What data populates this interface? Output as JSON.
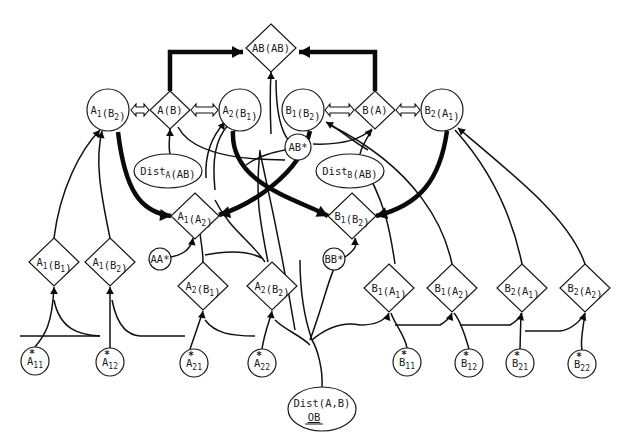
{
  "diagram": {
    "nodes": [
      {
        "id": "AB_AB",
        "shape": "diamond",
        "x": 271,
        "y": 48,
        "w": 50,
        "h": 48,
        "text": [
          {
            "t": "AB(AB)"
          }
        ]
      },
      {
        "id": "A1_B2_c",
        "shape": "circle",
        "x": 108,
        "y": 110,
        "r": 21,
        "text": [
          {
            "t": "A"
          },
          {
            "t": "1",
            "sub": true
          },
          {
            "t": "(B"
          },
          {
            "t": "2",
            "sub": true
          },
          {
            "t": ")"
          }
        ]
      },
      {
        "id": "A_B",
        "shape": "diamond",
        "x": 170,
        "y": 110,
        "w": 40,
        "h": 38,
        "text": [
          {
            "t": "A(B)"
          }
        ]
      },
      {
        "id": "A2_B1_c",
        "shape": "circle",
        "x": 240,
        "y": 110,
        "r": 21,
        "text": [
          {
            "t": "A"
          },
          {
            "t": "2",
            "sub": true
          },
          {
            "t": "(B"
          },
          {
            "t": "1",
            "sub": true
          },
          {
            "t": ")"
          }
        ]
      },
      {
        "id": "B1_B2_c",
        "shape": "circle",
        "x": 303,
        "y": 110,
        "r": 21,
        "text": [
          {
            "t": "B"
          },
          {
            "t": "1",
            "sub": true
          },
          {
            "t": "(B"
          },
          {
            "t": "2",
            "sub": true
          },
          {
            "t": ")"
          }
        ]
      },
      {
        "id": "B_A",
        "shape": "diamond",
        "x": 375,
        "y": 110,
        "w": 40,
        "h": 38,
        "text": [
          {
            "t": "B(A)"
          }
        ]
      },
      {
        "id": "B2_A1_c",
        "shape": "circle",
        "x": 442,
        "y": 110,
        "r": 21,
        "text": [
          {
            "t": "B"
          },
          {
            "t": "2",
            "sub": true
          },
          {
            "t": "(A"
          },
          {
            "t": "1",
            "sub": true
          },
          {
            "t": ")"
          }
        ]
      },
      {
        "id": "AB_star",
        "shape": "circle",
        "x": 298,
        "y": 147,
        "r": 13,
        "text": [
          {
            "t": "AB*"
          }
        ]
      },
      {
        "id": "DistA_AB",
        "shape": "ellipse",
        "x": 168,
        "y": 171,
        "rx": 34,
        "ry": 17,
        "text": [
          {
            "t": "Dist"
          },
          {
            "t": "A",
            "sub": true
          },
          {
            "t": "(AB)"
          }
        ]
      },
      {
        "id": "DistB_AB",
        "shape": "ellipse",
        "x": 350,
        "y": 171,
        "rx": 34,
        "ry": 17,
        "text": [
          {
            "t": "Dist"
          },
          {
            "t": "B",
            "sub": true
          },
          {
            "t": "(AB)"
          }
        ]
      },
      {
        "id": "A1_A2",
        "shape": "diamond",
        "x": 195,
        "y": 216,
        "w": 48,
        "h": 46,
        "text": [
          {
            "t": "A"
          },
          {
            "t": "1",
            "sub": true
          },
          {
            "t": "(A"
          },
          {
            "t": "2",
            "sub": true
          },
          {
            "t": ")"
          }
        ]
      },
      {
        "id": "B1_B2_d",
        "shape": "diamond",
        "x": 352,
        "y": 216,
        "w": 48,
        "h": 46,
        "text": [
          {
            "t": "B"
          },
          {
            "t": "1",
            "sub": true
          },
          {
            "t": "(B"
          },
          {
            "t": "2",
            "sub": true
          },
          {
            "t": ")"
          }
        ]
      },
      {
        "id": "AA_star",
        "shape": "circle",
        "x": 160,
        "y": 259,
        "r": 11,
        "text": [
          {
            "t": "AA*"
          }
        ]
      },
      {
        "id": "BB_star",
        "shape": "circle",
        "x": 334,
        "y": 259,
        "r": 11,
        "text": [
          {
            "t": "BB*"
          }
        ]
      },
      {
        "id": "A1_B1_d",
        "shape": "diamond",
        "x": 54,
        "y": 262,
        "w": 50,
        "h": 48,
        "text": [
          {
            "t": "A"
          },
          {
            "t": "1",
            "sub": true
          },
          {
            "t": "(B"
          },
          {
            "t": "1",
            "sub": true
          },
          {
            "t": ")"
          }
        ]
      },
      {
        "id": "A1_B2_d",
        "shape": "diamond",
        "x": 110,
        "y": 262,
        "w": 50,
        "h": 48,
        "text": [
          {
            "t": "A"
          },
          {
            "t": "1",
            "sub": true
          },
          {
            "t": "(B"
          },
          {
            "t": "2",
            "sub": true
          },
          {
            "t": ")"
          }
        ]
      },
      {
        "id": "A2_B1_d",
        "shape": "diamond",
        "x": 203,
        "y": 286,
        "w": 50,
        "h": 48,
        "text": [
          {
            "t": "A"
          },
          {
            "t": "2",
            "sub": true
          },
          {
            "t": "(B"
          },
          {
            "t": "1",
            "sub": true
          },
          {
            "t": ")"
          }
        ]
      },
      {
        "id": "A2_B2_d",
        "shape": "diamond",
        "x": 272,
        "y": 286,
        "w": 50,
        "h": 48,
        "text": [
          {
            "t": "A"
          },
          {
            "t": "2",
            "sub": true
          },
          {
            "t": "(B"
          },
          {
            "t": "2",
            "sub": true
          },
          {
            "t": ")"
          }
        ]
      },
      {
        "id": "B1_A1_d",
        "shape": "diamond",
        "x": 389,
        "y": 288,
        "w": 50,
        "h": 48,
        "text": [
          {
            "t": "B"
          },
          {
            "t": "1",
            "sub": true
          },
          {
            "t": "(A"
          },
          {
            "t": "1",
            "sub": true
          },
          {
            "t": ")"
          }
        ]
      },
      {
        "id": "B1_A2_d",
        "shape": "diamond",
        "x": 452,
        "y": 288,
        "w": 50,
        "h": 48,
        "text": [
          {
            "t": "B"
          },
          {
            "t": "1",
            "sub": true
          },
          {
            "t": "(A"
          },
          {
            "t": "2",
            "sub": true
          },
          {
            "t": ")"
          }
        ]
      },
      {
        "id": "B2_A1_d",
        "shape": "diamond",
        "x": 522,
        "y": 288,
        "w": 50,
        "h": 48,
        "text": [
          {
            "t": "B"
          },
          {
            "t": "2",
            "sub": true
          },
          {
            "t": "(A"
          },
          {
            "t": "1",
            "sub": true
          },
          {
            "t": ")"
          }
        ]
      },
      {
        "id": "B2_A2_d",
        "shape": "diamond",
        "x": 585,
        "y": 288,
        "w": 50,
        "h": 48,
        "text": [
          {
            "t": "B"
          },
          {
            "t": "2",
            "sub": true
          },
          {
            "t": "(A"
          },
          {
            "t": "2",
            "sub": true
          },
          {
            "t": ")"
          }
        ]
      },
      {
        "id": "A11s",
        "shape": "circle",
        "x": 35,
        "y": 361,
        "r": 14,
        "text": [
          {
            "t": "A"
          },
          {
            "t": "11",
            "sub": true
          }
        ],
        "star": true
      },
      {
        "id": "A12s",
        "shape": "circle",
        "x": 110,
        "y": 362,
        "r": 14,
        "text": [
          {
            "t": "A"
          },
          {
            "t": "12",
            "sub": true
          }
        ],
        "star": true
      },
      {
        "id": "A21s",
        "shape": "circle",
        "x": 194,
        "y": 363,
        "r": 14,
        "text": [
          {
            "t": "A"
          },
          {
            "t": "21",
            "sub": true
          }
        ],
        "star": true
      },
      {
        "id": "A22s",
        "shape": "circle",
        "x": 262,
        "y": 363,
        "r": 14,
        "text": [
          {
            "t": "A"
          },
          {
            "t": "22",
            "sub": true
          }
        ],
        "star": true
      },
      {
        "id": "B11s",
        "shape": "circle",
        "x": 407,
        "y": 362,
        "r": 14,
        "text": [
          {
            "t": "B"
          },
          {
            "t": "11",
            "sub": true
          }
        ],
        "star": true
      },
      {
        "id": "B12s",
        "shape": "circle",
        "x": 469,
        "y": 363,
        "r": 14,
        "text": [
          {
            "t": "B"
          },
          {
            "t": "12",
            "sub": true
          }
        ],
        "star": true
      },
      {
        "id": "B21s",
        "shape": "circle",
        "x": 520,
        "y": 363,
        "r": 14,
        "text": [
          {
            "t": "B"
          },
          {
            "t": "21",
            "sub": true
          }
        ],
        "star": true
      },
      {
        "id": "B22s",
        "shape": "circle",
        "x": 582,
        "y": 364,
        "r": 14,
        "text": [
          {
            "t": "B"
          },
          {
            "t": "22",
            "sub": true
          }
        ],
        "star": true
      },
      {
        "id": "Dist_AB_OB",
        "shape": "ellipse",
        "x": 322,
        "y": 409,
        "rx": 34,
        "ry": 22,
        "text": [
          {
            "t": "Dist(A,B)"
          }
        ],
        "text2": "OB"
      }
    ],
    "double_arrows": [
      {
        "x1": 131,
        "x2": 149,
        "y": 110
      },
      {
        "x1": 191,
        "x2": 218,
        "y": 110
      },
      {
        "x1": 325,
        "x2": 354,
        "y": 110
      },
      {
        "x1": 396,
        "x2": 420,
        "y": 110
      }
    ],
    "bold_edges": [
      {
        "d": "M170,91 L170,52 L243,52",
        "arrow_end": [
          243,
          52,
          0
        ],
        "arrow_start": [
          170,
          91,
          90
        ]
      },
      {
        "d": "M375,91 L375,52 L299,52",
        "arrow_end": [
          299,
          52,
          180
        ],
        "arrow_start": [
          375,
          91,
          90
        ]
      },
      {
        "d": "M118,132 C125,190 140,212 171,216",
        "arrow_end": [
          171,
          216,
          5
        ],
        "arrow_start": [
          118,
          132,
          -100
        ]
      },
      {
        "d": "M310,131 C300,175 250,205 219,215",
        "arrow_end": [
          219,
          215,
          165
        ],
        "arrow_start": [
          310,
          131,
          -75
        ]
      },
      {
        "d": "M233,131 C230,185 300,200 328,216",
        "arrow_end": [
          328,
          216,
          25
        ],
        "arrow_start": [
          233,
          131,
          -95
        ]
      },
      {
        "d": "M447,131 C440,180 420,205 376,216",
        "arrow_end": [
          376,
          216,
          165
        ],
        "arrow_start": [
          447,
          131,
          -80
        ]
      }
    ],
    "edges": [
      {
        "d": "M54,238 C60,190 80,150 100,130",
        "arrow": [
          100,
          130,
          -50
        ]
      },
      {
        "d": "M110,238 C100,190 95,160 102,131",
        "arrow": [
          102,
          131,
          -80
        ]
      },
      {
        "d": "M170,154 C168,145 170,138 170,129",
        "arrow": [
          170,
          129,
          -90
        ]
      },
      {
        "d": "M178,127 C190,150 230,160 285,160"
      },
      {
        "d": "M271,134 C270,110 270,90 271,72",
        "arrow": [
          271,
          72,
          -90
        ]
      },
      {
        "d": "M289,141 C280,130 276,110 276,80"
      },
      {
        "d": "M206,178 C205,160 208,140 225,122",
        "arrow": [
          225,
          122,
          -55
        ]
      },
      {
        "d": "M215,190 C212,160 215,140 228,125"
      },
      {
        "d": "M313,144 C340,145 360,140 372,129",
        "arrow": [
          372,
          129,
          -50
        ]
      },
      {
        "d": "M360,154 C362,145 367,138 372,130"
      },
      {
        "d": "M368,150 C350,140 338,128 326,122",
        "arrow": [
          326,
          122,
          -150
        ]
      },
      {
        "d": "M268,262 C260,220 255,200 260,150"
      },
      {
        "d": "M246,165 C260,155 275,152 285,150"
      },
      {
        "d": "M395,264 C390,230 385,200 360,160"
      },
      {
        "d": "M452,264 C445,230 420,170 330,125"
      },
      {
        "d": "M522,264 C515,230 500,180 455,130"
      },
      {
        "d": "M585,264 C570,220 520,180 458,128",
        "arrow": [
          458,
          128,
          -140
        ]
      },
      {
        "d": "M203,262 C203,248 200,240 200,230"
      },
      {
        "d": "M171,257 C180,255 190,252 193,238",
        "arrow": [
          193,
          238,
          -80
        ]
      },
      {
        "d": "M345,257 C355,250 358,245 355,238",
        "arrow": [
          355,
          238,
          -90
        ]
      },
      {
        "d": "M205,255 C230,250 250,252 262,258"
      },
      {
        "d": "M215,200 C230,230 250,240 265,262"
      },
      {
        "d": "M260,152 C270,200 280,240 295,330"
      },
      {
        "d": "M35,347 C45,335 52,325 54,287",
        "arrow": [
          54,
          287,
          -90
        ]
      },
      {
        "d": "M54,300 C60,330 80,335 100,336"
      },
      {
        "d": "M110,348 L110,287",
        "arrow": [
          110,
          287,
          -90
        ]
      },
      {
        "d": "M112,300 C118,330 130,335 140,336 L185,336"
      },
      {
        "d": "M190,349 C195,335 200,320 203,311",
        "arrow": [
          203,
          311,
          -80
        ]
      },
      {
        "d": "M205,320 C215,333 230,336 255,336"
      },
      {
        "d": "M262,349 C265,330 270,320 272,311",
        "arrow": [
          272,
          311,
          -80
        ]
      },
      {
        "d": "M275,320 C285,330 300,335 310,345"
      },
      {
        "d": "M322,387 C323,370 318,350 312,340 C305,320 300,290 300,260"
      },
      {
        "d": "M312,340 C330,325 345,322 360,325 C375,325 385,320 389,313",
        "arrow": [
          389,
          313,
          -70
        ]
      },
      {
        "d": "M310,340 C325,300 330,270 340,259"
      },
      {
        "d": "M407,348 C405,335 395,325 391,313"
      },
      {
        "d": "M395,325 L440,325 C445,322 450,318 452,313",
        "arrow": [
          452,
          313,
          -70
        ]
      },
      {
        "d": "M469,349 C465,335 460,320 454,313"
      },
      {
        "d": "M460,325 L510,325 C515,322 520,318 522,313",
        "arrow": [
          522,
          313,
          -75
        ]
      },
      {
        "d": "M520,349 L521,313"
      },
      {
        "d": "M525,331 L560,331 C570,330 580,322 585,313",
        "arrow": [
          585,
          313,
          -70
        ]
      },
      {
        "d": "M582,350 C580,340 583,330 585,313"
      },
      {
        "d": "M20,336 L100,336"
      }
    ]
  }
}
